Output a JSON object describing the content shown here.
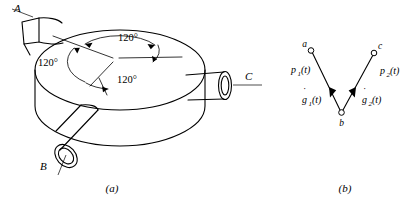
{
  "figure": {
    "caption_a": "(a)",
    "caption_b": "(b)",
    "part_a": {
      "name": "three-port-cylindrical-body",
      "ports": [
        {
          "id": "A",
          "label": "A",
          "position": "upper-left",
          "shape": "rectangular-tube"
        },
        {
          "id": "B",
          "label": "B",
          "position": "lower-left",
          "shape": "round-tube-open-end"
        },
        {
          "id": "C",
          "label": "C",
          "position": "right",
          "shape": "round-tube-open-end"
        }
      ],
      "angles": [
        {
          "label": "120°",
          "id": "angle-top"
        },
        {
          "label": "120°",
          "id": "angle-left"
        },
        {
          "label": "120°",
          "id": "angle-bottom"
        }
      ],
      "angle_value": "120°",
      "angle_count": 3
    },
    "part_b": {
      "name": "signal-flow-graph",
      "nodes": [
        {
          "id": "a",
          "label": "a",
          "x": 310,
          "y": 50
        },
        {
          "id": "b",
          "label": "b",
          "x": 341,
          "y": 113
        },
        {
          "id": "c",
          "label": "c",
          "x": 375,
          "y": 53
        }
      ],
      "edges": [
        {
          "id": "edge-a-b",
          "from": "a",
          "to": "b",
          "upper_label": "p",
          "upper_sub": "1",
          "upper_arg": "(t)",
          "lower_label": "g",
          "lower_sub": "1",
          "lower_arg": "(t)",
          "lower_accent": "dot"
        },
        {
          "id": "edge-c-b",
          "from": "c",
          "to": "b",
          "upper_label": "p",
          "upper_sub": "2",
          "upper_arg": "(t)",
          "lower_label": "g",
          "lower_sub": "2",
          "lower_arg": "(t)",
          "lower_accent": "dot"
        }
      ],
      "edge_labels": {
        "p1": "p",
        "p1_sub": "1",
        "p1_arg": "(t)",
        "p2": "p",
        "p2_sub": "2",
        "p2_arg": "(t)",
        "g1": "g",
        "g1_sub": "1",
        "g1_arg": "(t)",
        "g2": "g",
        "g2_sub": "2",
        "g2_arg": "(t)"
      }
    }
  },
  "colors": {
    "ink": "#000000",
    "paper": "#ffffff"
  }
}
